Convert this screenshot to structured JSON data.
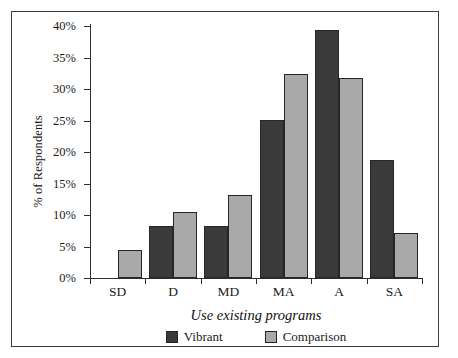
{
  "chart_data": {
    "type": "bar",
    "title": "",
    "xlabel": "Use existing programs",
    "ylabel": "% of Respondents",
    "categories": [
      "SD",
      "D",
      "MD",
      "MA",
      "A",
      "SA"
    ],
    "series": [
      {
        "name": "Vibrant",
        "color": "#3a3a3a",
        "values": [
          null,
          8.3,
          8.3,
          25.1,
          39.3,
          18.8
        ]
      },
      {
        "name": "Comparison",
        "color": "#a9a9a9",
        "values": [
          4.5,
          10.5,
          13.1,
          32.4,
          31.8,
          7.2
        ]
      }
    ],
    "ylim": [
      0,
      40
    ],
    "ytick_values": [
      0,
      5,
      10,
      15,
      20,
      25,
      30,
      35,
      40
    ],
    "ytick_labels": [
      "0%",
      "5%",
      "10%",
      "15%",
      "20%",
      "25%",
      "30%",
      "35%",
      "40%"
    ],
    "grid": false,
    "legend_position": "bottom-center",
    "annotations": []
  },
  "legend": {
    "items": [
      {
        "label": "Vibrant",
        "swatch": "dark-square-swatch"
      },
      {
        "label": "Comparison",
        "swatch": "light-square-swatch"
      }
    ]
  }
}
